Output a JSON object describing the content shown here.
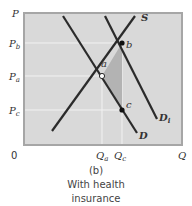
{
  "diagram": {
    "panel_label": "(b)",
    "caption_line1": "With health",
    "caption_line2": "insurance",
    "axes": {
      "y_label": "P",
      "x_label": "Q",
      "origin": "0"
    },
    "price_labels": [
      {
        "main": "P",
        "sub": "b"
      },
      {
        "main": "P",
        "sub": "a"
      },
      {
        "main": "P",
        "sub": "c"
      }
    ],
    "quantity_labels": [
      {
        "main": "Q",
        "sub": "a"
      },
      {
        "main": "Q",
        "sub": "c"
      }
    ],
    "curves": {
      "supply": "S",
      "demand": "D",
      "demand_insured": "D",
      "demand_insured_sub": "i"
    },
    "points": {
      "a": "a",
      "b": "b",
      "c": "c"
    },
    "colors": {
      "plot_bg": "#d9d9d9",
      "frame": "#a6a6a6",
      "curve": "#2b2b2b",
      "shaded": "#b3b3b3",
      "guide": "#f2f2f2"
    }
  }
}
